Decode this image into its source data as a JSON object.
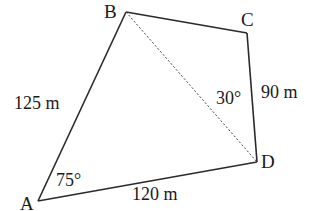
{
  "diagram": {
    "type": "quadrilateral",
    "vertices": {
      "A": {
        "label": "A"
      },
      "B": {
        "label": "B"
      },
      "C": {
        "label": "C"
      },
      "D": {
        "label": "D"
      }
    },
    "sides": {
      "AB": {
        "label": "125 m"
      },
      "AD": {
        "label": "120 m"
      },
      "CD": {
        "label": "90 m"
      }
    },
    "angles": {
      "A": {
        "label": "75°"
      },
      "BDC": {
        "label": "30°"
      }
    },
    "diagonal": {
      "from": "B",
      "to": "D",
      "style": "dotted"
    },
    "colors": {
      "stroke": "#2a2a2a",
      "text": "#1a1a1a",
      "background": "#ffffff"
    }
  }
}
